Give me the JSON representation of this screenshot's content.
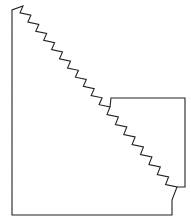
{
  "diagram": {
    "type": "line-drawing",
    "stroke_color": "#222222",
    "background": "#ffffff",
    "outer_shape": {
      "left_edge": {
        "x": 12,
        "y1": 10,
        "y2": 215
      },
      "bottom_edge": {
        "y": 215,
        "x1": 12,
        "x2": 172
      },
      "top_start": {
        "x": 12,
        "y": 10
      },
      "zigzag_start": {
        "x": 23,
        "y": 6
      },
      "zigzag_end": {
        "x": 177,
        "y": 187
      }
    },
    "inset_square": {
      "top_left": {
        "x": 111,
        "y": 98
      },
      "top_right": {
        "x": 185,
        "y": 98
      },
      "bottom_right": {
        "x": 185,
        "y": 187
      }
    },
    "zigzag": {
      "upper_teeth": 11,
      "lower_teeth": 8
    },
    "labels": []
  }
}
